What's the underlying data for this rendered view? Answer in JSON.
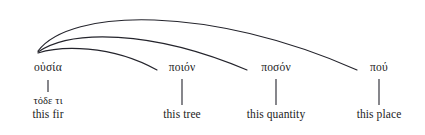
{
  "figure": {
    "kind": "linguistic-tree-diagram",
    "background_color": "#ffffff",
    "line_color": "#24242c",
    "text_color": "#1c1c1c"
  },
  "nodes": [
    {
      "id": "ousia",
      "greek": "οὐσία",
      "gloss_greek": "τόδε τι",
      "gloss_english": "this fir",
      "head_x": 48,
      "head_y": 72,
      "stem_top": 80,
      "stem_bottom": 92,
      "gloss_small_y": 95,
      "gloss_y": 108
    },
    {
      "id": "poion",
      "greek": "ποιόν",
      "gloss_greek": "",
      "gloss_english": "this tree",
      "head_x": 182,
      "head_y": 72,
      "stem_top": 79,
      "stem_bottom": 105,
      "gloss_small_y": 0,
      "gloss_y": 108
    },
    {
      "id": "poson",
      "greek": "ποσόν",
      "gloss_greek": "",
      "gloss_english": "this quantity",
      "head_x": 276,
      "head_y": 72,
      "stem_top": 79,
      "stem_bottom": 105,
      "gloss_small_y": 0,
      "gloss_y": 108
    },
    {
      "id": "pou",
      "greek": "πού",
      "gloss_greek": "",
      "gloss_english": "this place",
      "head_x": 379,
      "head_y": 72,
      "stem_top": 79,
      "stem_bottom": 105,
      "gloss_small_y": 0,
      "gloss_y": 108
    }
  ],
  "arcs": [
    {
      "id": "arc-ousia-poion",
      "from": "ousia",
      "to": "poion",
      "path": "M 38 53 C 60 46 110 44 157 70",
      "peak_y": 47
    },
    {
      "id": "arc-ousia-poson",
      "from": "ousia",
      "to": "poson",
      "path": "M 38 52 C 70 30 150 29 247 70",
      "peak_y": 33
    },
    {
      "id": "arc-ousia-pou",
      "from": "ousia",
      "to": "pou",
      "path": "M 38 51 C 70 8 210 5 357 70",
      "peak_y": 11
    }
  ]
}
